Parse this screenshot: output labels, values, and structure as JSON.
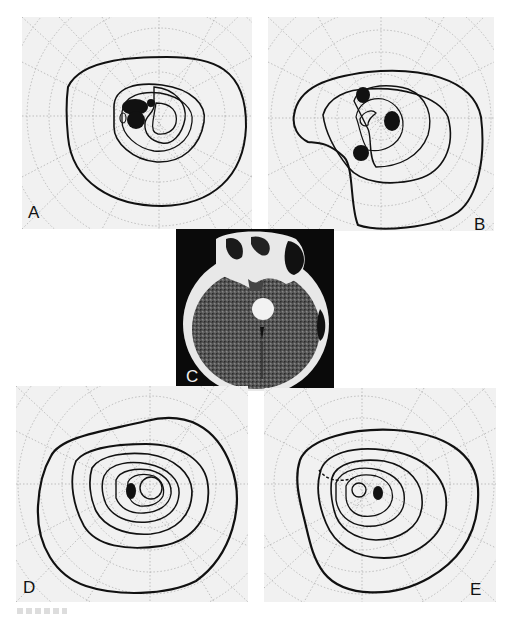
{
  "figure": {
    "panels": [
      {
        "id": "A",
        "label": "A",
        "type": "visual-field-perimetry",
        "description": "Goldmann visual field with central scotomas (left side) and constricted isopters"
      },
      {
        "id": "B",
        "label": "B",
        "type": "visual-field-perimetry",
        "description": "Goldmann visual field with irregular isopters and multiple scotomas"
      },
      {
        "id": "C",
        "label": "C",
        "type": "ct-scan",
        "description": "Axial CT brain scan showing enhancing round suprasellar mass"
      },
      {
        "id": "D",
        "label": "D",
        "type": "visual-field-perimetry",
        "description": "Goldmann visual field, concentric isopters with blind spot scotoma"
      },
      {
        "id": "E",
        "label": "E",
        "type": "visual-field-perimetry",
        "description": "Goldmann visual field, concentric isopters with blind spot scotoma and dashed superior boundary"
      }
    ],
    "axis_tick_labels": {
      "A": [
        "135",
        "150",
        "165",
        "180",
        "195",
        "210",
        "225",
        "240",
        "255",
        "270",
        "285"
      ],
      "B": [
        "45",
        "30",
        "15",
        "0",
        "345",
        "330",
        "315",
        "300",
        "285",
        "270",
        "255"
      ],
      "D": [
        "165",
        "180",
        "195",
        "210",
        "225",
        "240",
        "255",
        "270",
        "285",
        "300"
      ],
      "E": [
        "45",
        "30",
        "15",
        "0",
        "345",
        "330",
        "315",
        "240",
        "255",
        "270",
        "285",
        "300"
      ]
    },
    "colors": {
      "background": "#ffffff",
      "chart_bg": "#f1f1f1",
      "isopter": "#111111",
      "grid": "#9a9a9a",
      "ct_bg": "#0a0a0a"
    }
  }
}
